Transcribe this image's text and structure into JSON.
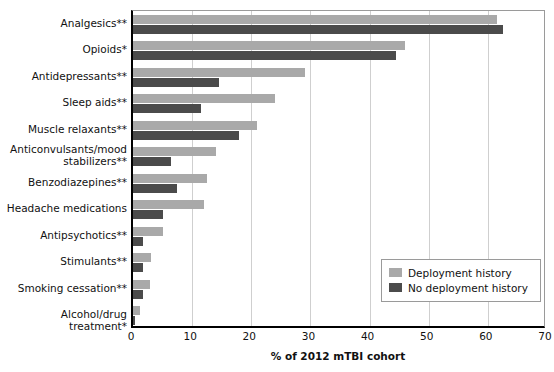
{
  "chart_data": {
    "type": "bar",
    "orientation": "horizontal",
    "title": "",
    "xlabel": "% of 2012 mTBI cohort",
    "ylabel": "",
    "xlim": [
      0,
      70
    ],
    "xticks": [
      0,
      10,
      20,
      30,
      40,
      50,
      60,
      70
    ],
    "grid": true,
    "legend_position": "lower-right",
    "categories": [
      "Analgesics**",
      "Opioids*",
      "Antidepressants**",
      "Sleep aids**",
      "Muscle relaxants**",
      "Anticonvulsants/mood\nstabilizers**",
      "Benzodiazepines**",
      "Headache medications",
      "Antipsychotics**",
      "Stimulants**",
      "Smoking cessation**",
      "Alcohol/drug treatment*"
    ],
    "series": [
      {
        "name": "Deployment history",
        "color": "#a9a9a9",
        "values": [
          61.5,
          46.0,
          29.0,
          24.0,
          21.0,
          14.0,
          12.5,
          12.0,
          5.0,
          3.0,
          2.8,
          1.1
        ]
      },
      {
        "name": "No deployment history",
        "color": "#4b4b4b",
        "values": [
          62.5,
          44.5,
          14.5,
          11.5,
          18.0,
          6.5,
          7.5,
          5.0,
          1.7,
          1.7,
          1.7,
          0.4
        ]
      }
    ]
  },
  "legend": {
    "entries": [
      {
        "label": "Deployment history",
        "color": "#a9a9a9"
      },
      {
        "label": "No deployment history",
        "color": "#4b4b4b"
      }
    ]
  },
  "axis": {
    "x_title": "% of 2012 mTBI cohort",
    "tick_labels": [
      "0",
      "10",
      "20",
      "30",
      "40",
      "50",
      "60",
      "70"
    ]
  }
}
